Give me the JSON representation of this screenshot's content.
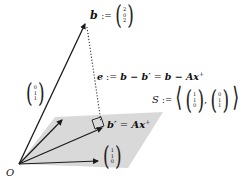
{
  "diagram": {
    "type": "vector-projection",
    "origin_label": "O",
    "vectors": {
      "b": {
        "name": "b",
        "def": ":=",
        "components": [
          "2",
          "0",
          "2"
        ]
      },
      "basis1": {
        "components": [
          "1",
          "1",
          "0"
        ]
      },
      "basis2": {
        "components": [
          "0",
          "1",
          "1"
        ]
      },
      "b_prime": {
        "label_lhs": "b′",
        "eq": "=",
        "label_rhs": "Ax",
        "superscript": "+"
      }
    },
    "error": {
      "lhs": "e",
      "def": ":=",
      "expr1": "b − b′",
      "eq": "=",
      "expr2_a": "b − A",
      "expr2_x": "x",
      "superscript": "+"
    },
    "subspace": {
      "name": "S",
      "def": ":=",
      "span_open": "⟨",
      "span_close": "⟩",
      "comma": ",",
      "v1": [
        "1",
        "1",
        "0"
      ],
      "v2": [
        "0",
        "1",
        "1"
      ]
    },
    "colors": {
      "plane": "#d9d9d9",
      "lines": "#1a1a1a",
      "dotted": "#333333"
    }
  }
}
